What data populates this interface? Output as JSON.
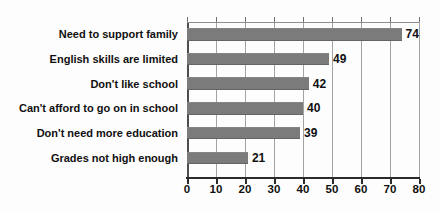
{
  "colors": {
    "background": "#fdfdfd",
    "bar_fill": "#7b7b7b",
    "gridline": "#a3a3a3",
    "axis_line": "#2b2b2b",
    "text": "#101010"
  },
  "chart_data": {
    "type": "bar",
    "orientation": "horizontal",
    "title": "",
    "xlabel": "",
    "ylabel": "",
    "categories": [
      "Need to support family",
      "English skills are limited",
      "Don't like school",
      "Can't afford to go on in school",
      "Don't need more education",
      "Grades not high enough"
    ],
    "values": [
      74,
      49,
      42,
      40,
      39,
      21
    ],
    "value_labels": [
      "74",
      "49",
      "42",
      "40",
      "39",
      "21"
    ],
    "xlim": [
      0,
      80
    ],
    "xticks": [
      0,
      10,
      20,
      30,
      40,
      50,
      60,
      70,
      80
    ],
    "grid": true,
    "legend": null
  }
}
